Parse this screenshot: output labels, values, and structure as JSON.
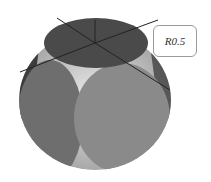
{
  "figure": {
    "label": "R0.5",
    "colors": {
      "top_face": "#4a4a4a",
      "left_face": "#6e6e6e",
      "right_face": "#8a8a8a",
      "highlight": "#d8d8d8",
      "label_border": "#9a9a9a"
    }
  }
}
